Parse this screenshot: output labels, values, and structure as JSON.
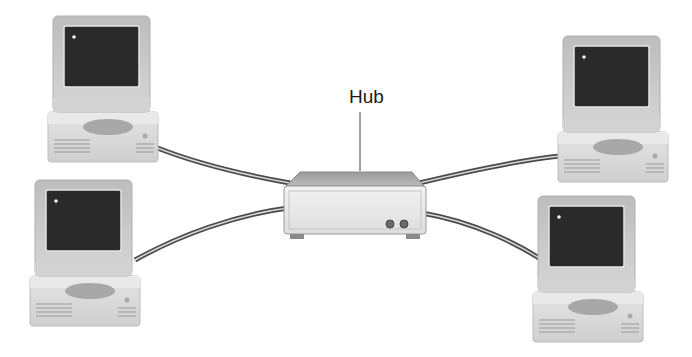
{
  "diagram": {
    "type": "star network topology",
    "hub": {
      "label": "Hub"
    },
    "computers": [
      {
        "id": "computer-top-left",
        "x": 48,
        "y": 16
      },
      {
        "id": "computer-bottom-left",
        "x": 30,
        "y": 180
      },
      {
        "id": "computer-top-right",
        "x": 558,
        "y": 36
      },
      {
        "id": "computer-bottom-right",
        "x": 533,
        "y": 196
      }
    ],
    "colors": {
      "screen": "#2a2a2a",
      "bezel": "#c8c8c8",
      "case": "#dcdcdc",
      "cable": "#555555",
      "hub_body": "#e6e6e6"
    }
  }
}
